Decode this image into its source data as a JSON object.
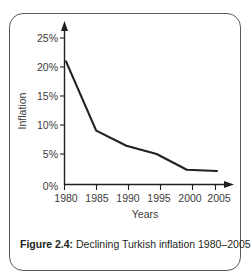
{
  "figure": {
    "caption_label": "Figure 2.4:",
    "caption_text": "Declining Turkish inflation 1980–2005",
    "frame_color": "#5a5a5a"
  },
  "chart_data": {
    "type": "line",
    "title": "",
    "subtitle": "",
    "xlabel": "Years",
    "ylabel": "Inflation",
    "x": [
      1980,
      1985,
      1990,
      1995,
      2000,
      2005
    ],
    "categories": [
      "1980",
      "1985",
      "1990",
      "1995",
      "2000",
      "2005"
    ],
    "values": [
      21.0,
      9.2,
      6.6,
      5.2,
      2.5,
      2.3
    ],
    "series": [
      {
        "name": "Turkish inflation",
        "values": [
          21.0,
          9.2,
          6.6,
          5.2,
          2.5,
          2.3
        ],
        "color": "#231f20"
      }
    ],
    "xlim": [
      1980,
      2005
    ],
    "ylim": [
      0,
      25
    ],
    "ytick_values": [
      0,
      5,
      10,
      15,
      20,
      25
    ],
    "ytick_labels": [
      "0%",
      "5%",
      "10%",
      "15%",
      "20%",
      "25%"
    ],
    "xtick_labels": [
      "1980",
      "1985",
      "1990",
      "1995",
      "2000",
      "2005"
    ],
    "grid": false,
    "legend": false,
    "legend_position": "none",
    "axis_arrows": true,
    "line_color": "#231f20"
  }
}
